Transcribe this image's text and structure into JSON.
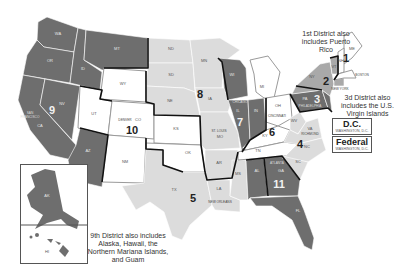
{
  "map": {
    "title": "Federal Judicial Circuits",
    "colors": {
      "dark": "#6e6e6e",
      "light": "#dcdcdc",
      "white": "#ffffff",
      "medium": "#a9a9a9",
      "border": "#111111"
    },
    "districts": [
      {
        "number": "1",
        "shade": "white",
        "states": [
          "ME",
          "NH",
          "MA",
          "RI"
        ]
      },
      {
        "number": "2",
        "shade": "medium",
        "states": [
          "NY",
          "VT",
          "CT"
        ]
      },
      {
        "number": "3",
        "shade": "dark",
        "states": [
          "PA",
          "NJ",
          "DE"
        ]
      },
      {
        "number": "4",
        "shade": "light",
        "states": [
          "MD",
          "WV",
          "VA",
          "NC",
          "SC"
        ]
      },
      {
        "number": "5",
        "shade": "light",
        "states": [
          "TX",
          "LA",
          "MS"
        ]
      },
      {
        "number": "6",
        "shade": "white",
        "states": [
          "OH",
          "MI",
          "KY",
          "TN"
        ]
      },
      {
        "number": "7",
        "shade": "dark",
        "states": [
          "WI",
          "IL",
          "IN"
        ]
      },
      {
        "number": "8",
        "shade": "light",
        "states": [
          "ND",
          "SD",
          "NE",
          "MN",
          "IA",
          "MO",
          "AR"
        ]
      },
      {
        "number": "9",
        "shade": "dark",
        "states": [
          "WA",
          "OR",
          "CA",
          "NV",
          "ID",
          "MT",
          "AZ",
          "AK",
          "HI"
        ]
      },
      {
        "number": "10",
        "shade": "white",
        "states": [
          "WY",
          "UT",
          "CO",
          "KS",
          "NM",
          "OK"
        ]
      },
      {
        "number": "11",
        "shade": "dark",
        "states": [
          "AL",
          "GA",
          "FL"
        ]
      }
    ],
    "district_labels": [
      "1",
      "2",
      "3",
      "4",
      "5",
      "6",
      "7",
      "8",
      "9",
      "10",
      "11"
    ],
    "state_labels": {
      "WA": "WA",
      "OR": "OR",
      "CA": "CA",
      "NV": "NV",
      "ID": "ID",
      "MT": "MT",
      "AZ": "AZ",
      "WY": "WY",
      "UT": "UT",
      "CO": "CO",
      "NM": "NM",
      "KS": "KS",
      "OK": "OK",
      "TX": "TX",
      "ND": "ND",
      "SD": "SD",
      "NE": "NE",
      "MN": "MN",
      "IA": "IA",
      "MO": "MO",
      "AR": "AR",
      "LA": "LA",
      "WI": "WI",
      "IL": "IL",
      "IN": "IN",
      "MI": "MI",
      "OH": "OH",
      "KY": "KY",
      "TN": "TN",
      "MS": "MS",
      "AL": "AL",
      "GA": "GA",
      "FL": "FL",
      "SC": "SC",
      "NC": "NC",
      "VA": "VA",
      "WV": "WV",
      "PA": "PA",
      "NY": "NY",
      "VT": "VT",
      "NH": "NH",
      "ME": "ME",
      "AK": "AK",
      "HI": "HI"
    },
    "cities": {
      "san_francisco": "SAN FRANCISCO",
      "denver": "DENVER",
      "st_louis": "ST. LOUIS",
      "chicago": "CHICAGO",
      "cincinnati": "CINCINNATI",
      "philadelphia": "PHILADELPHIA",
      "new_york": "NEW YORK",
      "boston": "BOSTON",
      "richmond": "RICHMOND",
      "new_orleans": "NEW ORLEANS",
      "atlanta": "ATLANTA",
      "dc": "DC"
    },
    "notes": {
      "first": "1st District also includes Puerto Rico",
      "third": "3d District also includes the U.S. Virgin Islands",
      "ninth": "9th District also includes Alaska, Hawaii, the Northern Mariana Islands, and Guam"
    },
    "courts": [
      {
        "title": "D.C.",
        "subtitle": "WASHINGTON, D.C."
      },
      {
        "title": "Federal",
        "subtitle": "WASHINGTON, D.C."
      }
    ]
  }
}
